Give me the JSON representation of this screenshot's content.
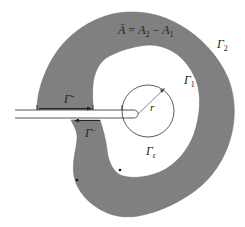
{
  "figure": {
    "equation": {
      "lhs": "Ā",
      "eq": " = ",
      "a2": "A",
      "a2_sub": "2",
      "minus": " − ",
      "a1": "A",
      "a1_sub": "1"
    },
    "labels": {
      "gamma2": {
        "base": "Γ",
        "sub": "2"
      },
      "gamma1": {
        "base": "Γ",
        "sub": "1"
      },
      "gamma_plus": {
        "base": "Γ",
        "sup": "+"
      },
      "gamma_minus": {
        "base": "Γ",
        "sup": "−"
      },
      "gamma_eps": {
        "base": "Γ",
        "sub": "ε"
      },
      "radius": "r"
    },
    "colors": {
      "region_fill": "#808080",
      "region_stroke": "#6e6e6e",
      "line": "#222222",
      "background": "#ffffff"
    }
  }
}
